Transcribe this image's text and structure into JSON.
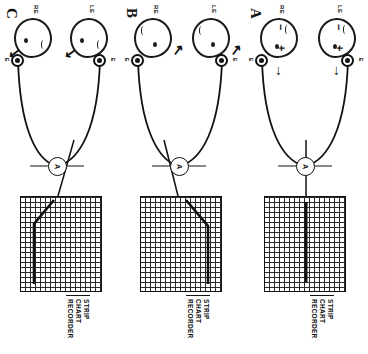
{
  "figure": {
    "ink_color": "#111111",
    "background": "#ffffff"
  },
  "panels": [
    {
      "id": "A",
      "letter": "A",
      "eyes": [
        {
          "id": "LE",
          "label": "LE",
          "minus": "−",
          "plus": "+",
          "gaze_arrow": "→"
        },
        {
          "id": "RE",
          "label": "RE",
          "minus": "−",
          "plus": "+",
          "gaze_arrow": "→"
        }
      ],
      "electrodes": [
        {
          "id": "E1",
          "label": "E"
        },
        {
          "id": "E2",
          "label": "E"
        }
      ],
      "amplifier": {
        "label": "A"
      },
      "recorder": {
        "title": "STRIP CHART\nRECORDER",
        "trace": "flat-baseline"
      }
    },
    {
      "id": "B",
      "letter": "B",
      "eyes": [
        {
          "id": "LE",
          "label": "LE",
          "gaze_arrow": "↖"
        },
        {
          "id": "RE",
          "label": "RE",
          "gaze_arrow": "↖"
        }
      ],
      "electrodes": [
        {
          "id": "E1",
          "label": "E"
        },
        {
          "id": "E2",
          "label": "E"
        }
      ],
      "amplifier": {
        "label": "A"
      },
      "recorder": {
        "title": "STRIP CHART\nRECORDER",
        "trace": "upward-step"
      }
    },
    {
      "id": "C",
      "letter": "C",
      "eyes": [
        {
          "id": "LE",
          "label": "LE",
          "gaze_arrow": "↘"
        },
        {
          "id": "RE",
          "label": "RE",
          "gaze_arrow": "↘"
        }
      ],
      "electrodes": [
        {
          "id": "E1",
          "label": "E"
        },
        {
          "id": "E2",
          "label": "E"
        }
      ],
      "amplifier": {
        "label": "A"
      },
      "recorder": {
        "title": "STRIP CHART\nRECORDER",
        "trace": "downward-step"
      }
    }
  ]
}
